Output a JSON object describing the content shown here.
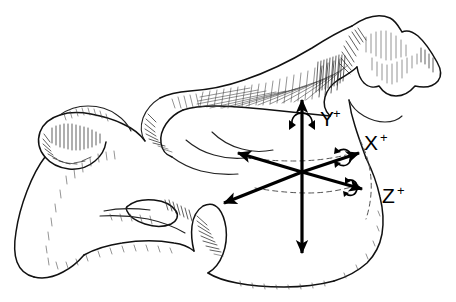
{
  "figure": {
    "background_color": "#ffffff",
    "ink_color": "#000000",
    "width": 456,
    "height": 302
  },
  "axes": {
    "origin": {
      "x": 302,
      "y": 172
    },
    "labels": {
      "y_positive": "Y",
      "y_superscript": "+",
      "x_positive": "X",
      "x_superscript": "+",
      "z_positive": "Z",
      "z_superscript": "+"
    },
    "arrows": [
      {
        "name": "y-positive-arrow",
        "from_x": 302,
        "from_y": 172,
        "to_x": 302,
        "to_y": 97,
        "label": "Y+"
      },
      {
        "name": "y-negative-arrow",
        "from_x": 302,
        "from_y": 172,
        "to_x": 302,
        "to_y": 256,
        "label": ""
      },
      {
        "name": "x-positive-arrow",
        "from_x": 302,
        "from_y": 172,
        "to_x": 362,
        "to_y": 152,
        "label": "X+"
      },
      {
        "name": "x-negative-arrow",
        "from_x": 302,
        "from_y": 172,
        "to_x": 234,
        "to_y": 152,
        "label": ""
      },
      {
        "name": "z-positive-arrow",
        "from_x": 302,
        "from_y": 172,
        "to_x": 367,
        "to_y": 190,
        "label": "Z+"
      },
      {
        "name": "z-negative-arrow",
        "from_x": 302,
        "from_y": 172,
        "to_x": 220,
        "to_y": 205,
        "label": ""
      }
    ],
    "rotation_indicators": [
      {
        "name": "y-rotation-arc",
        "about_axis": "Y",
        "x": 302,
        "y": 122
      },
      {
        "name": "x-rotation-arc",
        "about_axis": "X",
        "x": 345,
        "y": 157
      },
      {
        "name": "z-rotation-arc",
        "about_axis": "Z",
        "x": 352,
        "y": 187
      }
    ]
  },
  "anatomy": {
    "specimen": "cervical vertebra",
    "view": "lateral",
    "parts": [
      {
        "name": "spinous-process",
        "position": "upper-right"
      },
      {
        "name": "vertebral-body",
        "position": "lower-center"
      },
      {
        "name": "transverse-process",
        "position": "left"
      },
      {
        "name": "vertebral-foramen",
        "position": "center-left"
      },
      {
        "name": "superior-articular-facet",
        "position": "upper-middle"
      },
      {
        "name": "inferior-articular-process",
        "position": "lower-middle"
      }
    ]
  }
}
